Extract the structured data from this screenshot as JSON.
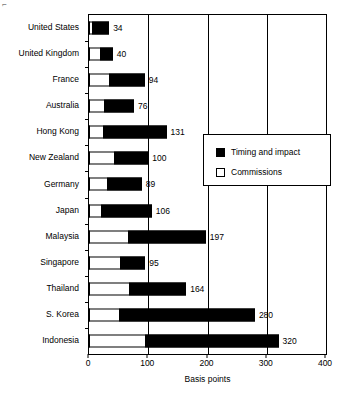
{
  "chart_data": {
    "type": "bar",
    "orientation": "horizontal",
    "stacked": true,
    "title": "",
    "xlabel": "Basis points",
    "ylabel": "",
    "xlim": [
      0,
      400
    ],
    "xticks": [
      0,
      100,
      200,
      300,
      400
    ],
    "grid": true,
    "grid_axis": "x",
    "legend_position": "middle-right-inside",
    "categories": [
      "United States",
      "United Kingdom",
      "France",
      "Australia",
      "Hong Kong",
      "New Zealand",
      "Germany",
      "Japan",
      "Malaysia",
      "Singapore",
      "Thailand",
      "S. Korea",
      "Indonesia"
    ],
    "series": [
      {
        "name": "Commissions",
        "color": "#ffffff",
        "values": [
          5,
          18,
          34,
          25,
          24,
          42,
          30,
          20,
          65,
          52,
          68,
          50,
          95
        ]
      },
      {
        "name": "Timing and impact",
        "color": "#000000",
        "values": [
          29,
          22,
          60,
          51,
          107,
          58,
          59,
          86,
          132,
          43,
          96,
          230,
          225
        ]
      }
    ],
    "totals": [
      34,
      40,
      94,
      76,
      131,
      100,
      89,
      106,
      197,
      95,
      164,
      280,
      320
    ],
    "data_labels": [
      "34",
      "40",
      "94",
      "76",
      "131",
      "100",
      "89",
      "106",
      "197",
      "95",
      "164",
      "280",
      "320"
    ]
  },
  "legend": {
    "items": [
      {
        "label": "Timing and impact",
        "swatch": "filled"
      },
      {
        "label": "Commissions",
        "swatch": "empty"
      }
    ]
  },
  "axis": {
    "x_title": "Basis points",
    "x_tick_labels": [
      "0",
      "100",
      "200",
      "300",
      "400"
    ]
  },
  "corner": {
    "mark": "⌐"
  }
}
